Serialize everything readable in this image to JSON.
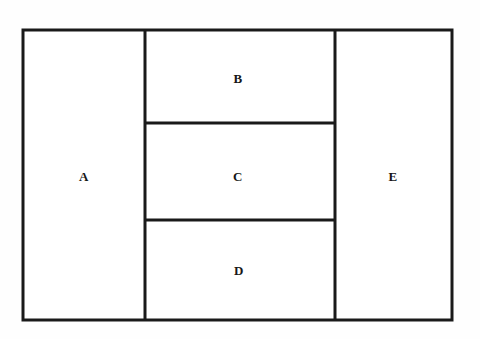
{
  "figure": {
    "background_color": "#fefefe",
    "stroke_color": "#1a1a1a",
    "fill_color": "#ffffff",
    "outer_box": {
      "x": 23,
      "y": 30,
      "width": 429,
      "height": 290,
      "stroke_width": 3
    },
    "dividers": {
      "vertical_a_b": 145,
      "vertical_b_e": 335,
      "horizontal_b_c": 123,
      "horizontal_c_d": 220,
      "stroke_width": 3
    },
    "regions": [
      {
        "id": "region-a",
        "label": "A",
        "x": 23,
        "y": 30,
        "width": 122,
        "height": 290,
        "label_x": 84,
        "label_y": 176
      },
      {
        "id": "region-b",
        "label": "B",
        "x": 145,
        "y": 30,
        "width": 190,
        "height": 93,
        "label_x": 238,
        "label_y": 78
      },
      {
        "id": "region-c",
        "label": "C",
        "x": 145,
        "y": 123,
        "width": 190,
        "height": 97,
        "label_x": 238,
        "label_y": 176
      },
      {
        "id": "region-d",
        "label": "D",
        "x": 145,
        "y": 220,
        "width": 190,
        "height": 100,
        "label_x": 239,
        "label_y": 270
      },
      {
        "id": "region-e",
        "label": "E",
        "x": 335,
        "y": 30,
        "width": 117,
        "height": 290,
        "label_x": 393,
        "label_y": 176
      }
    ]
  }
}
